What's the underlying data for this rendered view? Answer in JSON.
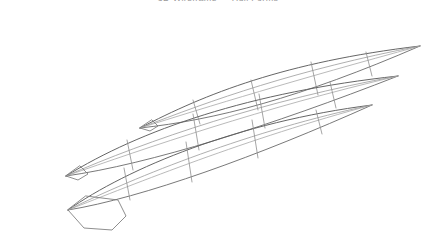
{
  "figure": {
    "title": "3D Wireframe — Hull Forms",
    "title_clipped": true,
    "background_color": "#ffffff",
    "width": 436,
    "height": 242,
    "line_colors": {
      "sheer": "#5d5d5d",
      "keel": "#6a6a6a",
      "chine": "#a8a8a8",
      "deck": "#9a9a9a",
      "frame": "#8e8e8e",
      "stern": "#7a7a7a"
    },
    "hulls": [
      {
        "name": "hull-upper",
        "bow_tip": [
          420,
          46
        ],
        "stern_tip": [
          140,
          128
        ],
        "sheer": "M 140 128 C 205 94, 285 62, 420 46",
        "keel": "M 140 128 C 215 120, 300 98, 420 46",
        "chine": "M 140 128 C 210 106, 295 80, 420 46",
        "deck": "M 140 128 C 212 100, 296 70, 420 46",
        "frames": [
          "M 193 100 L 200 124",
          "M 251 80 L 258 110",
          "M 311 62 L 318 95",
          "M 366 52 L 372 76"
        ],
        "stern_face": "M 140 128 L 150 131 L 158 126 L 152 120 Z"
      },
      {
        "name": "hull-middle",
        "bow_tip": [
          398,
          76
        ],
        "stern_tip": [
          66,
          176
        ],
        "sheer": "M 66 176 C 140 130, 250 92, 398 76",
        "keel": "M 66 176 C 150 164, 270 126, 398 76",
        "chine": "M 66 176 C 146 148, 262 108, 398 76",
        "deck": "M 66 176 C 148 140, 266 100, 398 76",
        "frames": [
          "M 127 140 L 133 170",
          "M 193 114 L 199 150",
          "M 259 94 L 265 128",
          "M 330 82 L 336 108"
        ],
        "stern_face": "M 66 176 L 78 180 L 88 174 L 80 166 Z"
      },
      {
        "name": "hull-lower",
        "bow_tip": [
          372,
          105
        ],
        "stern_tip": [
          68,
          210
        ],
        "sheer": "M 68 210 C 128 168, 238 122, 372 105",
        "keel": "M 68 210 C 142 198, 258 156, 372 105",
        "chine": "M 68 210 C 134 184, 248 138, 372 105",
        "deck": "M 68 210 C 136 176, 252 130, 372 105",
        "frames": [
          "M 124 168 L 130 200",
          "M 186 142 L 192 182",
          "M 252 120 L 258 158",
          "M 316 110 L 322 134"
        ],
        "stern_face": "M 68 210 L 84 228 L 112 230 L 126 216 L 118 200 L 86 196 Z"
      }
    ]
  }
}
